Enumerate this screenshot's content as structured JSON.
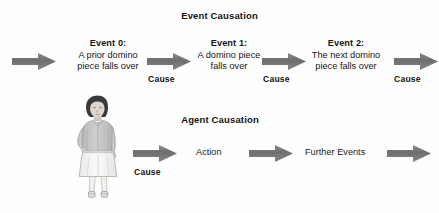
{
  "diagram": {
    "background_color": "#fefefe",
    "arrow_color": "#6f6f6f",
    "text_color": "#161616"
  },
  "sections": {
    "event_causation": {
      "title": "Event Causation",
      "events": [
        {
          "heading": "Event 0:",
          "line1": "A prior domino",
          "line2": "piece falls over"
        },
        {
          "heading": "Event 1:",
          "line1": "A domino piece",
          "line2": "falls over"
        },
        {
          "heading": "Event 2:",
          "line1": "The next domino",
          "line2": "piece falls over"
        }
      ],
      "cause_labels": [
        "Cause",
        "Cause",
        "Cause"
      ],
      "arrow_names": [
        "arrow-into-event-0",
        "arrow-event-0-to-event-1",
        "arrow-event-1-to-event-2",
        "arrow-out-of-event-2"
      ]
    },
    "agent_causation": {
      "title": "Agent Causation",
      "agent_figure_label": "standing-person-figure",
      "cause_label": "Cause",
      "nodes": [
        {
          "label": "Action"
        },
        {
          "label": "Further Events"
        }
      ],
      "arrow_names": [
        "arrow-agent-to-action",
        "arrow-action-to-further-events",
        "arrow-out-of-further-events"
      ]
    }
  }
}
